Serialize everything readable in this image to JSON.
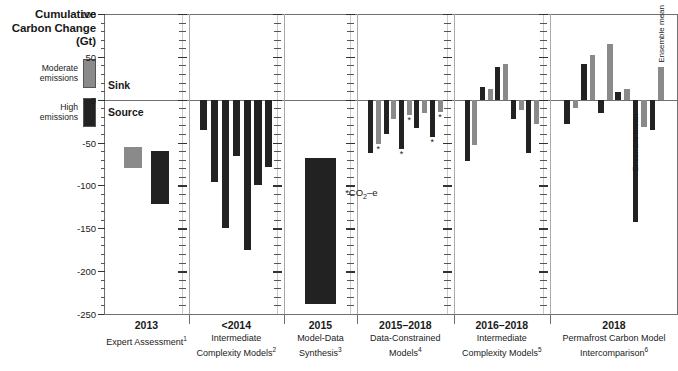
{
  "axis_title": "Cumulative\nCarbon\nChange (Gt)",
  "legend": {
    "items": [
      {
        "label": "Moderate\nemissions",
        "color": "#8a8a8a",
        "name": "moderate-emissions"
      },
      {
        "label": "High\nemissions",
        "color": "#222222",
        "name": "high-emissions"
      }
    ]
  },
  "inplot_labels": {
    "sink": "Sink",
    "source": "Source"
  },
  "annotations": [
    {
      "text": "*CO2-e",
      "html": "*CO<sub>2</sub>–e"
    }
  ],
  "chart_data": {
    "type": "bar",
    "title": "Cumulative Carbon Change (Gt)",
    "xlabel": "",
    "ylabel": "Cumulative Carbon Change (Gt)",
    "ylim": [
      -250,
      100
    ],
    "ytick_labels": [
      "100",
      "50",
      "0",
      "-50",
      "-100",
      "-150",
      "-200",
      "-250"
    ],
    "ytick_values": [
      100,
      50,
      0,
      -50,
      -100,
      -150,
      -200,
      -250
    ],
    "minor_tick_step": 10,
    "grid": false,
    "legend_position": "left",
    "zero_reference_labels": {
      "above": "Sink",
      "below": "Source"
    },
    "series_colors": {
      "moderate": "#8a8a8a",
      "high": "#222222"
    },
    "groups": [
      {
        "year": "2013",
        "name": "Expert Assessment",
        "footnote": "1",
        "bars": [
          {
            "value": -80,
            "start": -55,
            "series": "moderate",
            "asterisk": false,
            "note": ""
          },
          {
            "value": -122,
            "start": -60,
            "series": "high",
            "asterisk": false,
            "note": ""
          }
        ]
      },
      {
        "year": "<2014",
        "name": "Intermediate Complexity Models",
        "footnote": "2",
        "bars": [
          {
            "value": -35,
            "series": "high",
            "asterisk": false,
            "note": ""
          },
          {
            "value": -96,
            "series": "high",
            "asterisk": false,
            "note": ""
          },
          {
            "value": -150,
            "series": "high",
            "asterisk": false,
            "note": ""
          },
          {
            "value": -66,
            "series": "high",
            "asterisk": false,
            "note": ""
          },
          {
            "value": -175,
            "series": "high",
            "asterisk": false,
            "note": ""
          },
          {
            "value": -100,
            "series": "high",
            "asterisk": false,
            "note": ""
          },
          {
            "value": -78,
            "series": "high",
            "asterisk": false,
            "note": ""
          }
        ]
      },
      {
        "year": "2015",
        "name": "Model-Data Synthesis",
        "footnote": "3",
        "bars": [
          {
            "value": -238,
            "start": -68,
            "series": "high",
            "asterisk": false,
            "note": ""
          }
        ]
      },
      {
        "year": "2015–2018",
        "name": "Data-Constrained Models",
        "footnote": "4",
        "bars": [
          {
            "value": -62,
            "series": "high",
            "asterisk": false,
            "note": ""
          },
          {
            "value": -52,
            "series": "moderate",
            "asterisk": true,
            "note": ""
          },
          {
            "value": -40,
            "series": "high",
            "asterisk": false,
            "note": ""
          },
          {
            "value": -22,
            "series": "moderate",
            "asterisk": false,
            "note": ""
          },
          {
            "value": -58,
            "series": "high",
            "asterisk": true,
            "note": ""
          },
          {
            "value": -18,
            "series": "moderate",
            "asterisk": true,
            "note": ""
          },
          {
            "value": -33,
            "series": "high",
            "asterisk": false,
            "note": ""
          },
          {
            "value": -16,
            "series": "moderate",
            "asterisk": false,
            "note": ""
          },
          {
            "value": -44,
            "series": "high",
            "asterisk": true,
            "note": ""
          },
          {
            "value": -14,
            "series": "moderate",
            "asterisk": true,
            "note": ""
          }
        ]
      },
      {
        "year": "2016–2018",
        "name": "Intermediate Complexity Models",
        "footnote": "5",
        "bars": [
          {
            "value": -72,
            "series": "high",
            "asterisk": false,
            "note": ""
          },
          {
            "value": -53,
            "series": "moderate",
            "asterisk": false,
            "note": ""
          },
          {
            "value": 15,
            "series": "high",
            "asterisk": false,
            "note": ""
          },
          {
            "value": 12,
            "series": "moderate",
            "asterisk": false,
            "note": ""
          },
          {
            "value": 38,
            "series": "high",
            "asterisk": false,
            "note": ""
          },
          {
            "value": 42,
            "series": "moderate",
            "asterisk": false,
            "note": ""
          },
          {
            "value": -22,
            "series": "high",
            "asterisk": false,
            "note": ""
          },
          {
            "value": -12,
            "series": "moderate",
            "asterisk": false,
            "note": ""
          },
          {
            "value": -62,
            "series": "high",
            "asterisk": false,
            "note": ""
          },
          {
            "value": -28,
            "series": "moderate",
            "asterisk": false,
            "note": ""
          }
        ]
      },
      {
        "year": "2018",
        "name": "Permafrost Carbon Model Intercomparison",
        "footnote": "6",
        "bars": [
          {
            "value": -28,
            "series": "high",
            "asterisk": false,
            "note": ""
          },
          {
            "value": -10,
            "series": "moderate",
            "asterisk": false,
            "note": ""
          },
          {
            "value": 42,
            "series": "high",
            "asterisk": false,
            "note": ""
          },
          {
            "value": 52,
            "series": "moderate",
            "asterisk": false,
            "note": ""
          },
          {
            "value": -15,
            "series": "high",
            "asterisk": false,
            "note": ""
          },
          {
            "value": 65,
            "series": "moderate",
            "asterisk": false,
            "note": ""
          },
          {
            "value": 9,
            "series": "high",
            "asterisk": false,
            "note": ""
          },
          {
            "value": 12,
            "series": "moderate",
            "asterisk": false,
            "note": ""
          },
          {
            "value": -143,
            "series": "high",
            "asterisk": false,
            "note": "Ensemble mean"
          },
          {
            "value": -32,
            "series": "moderate",
            "asterisk": false,
            "note": ""
          },
          {
            "value": -35,
            "series": "high",
            "asterisk": false,
            "note": ""
          },
          {
            "value": 38,
            "series": "moderate",
            "asterisk": false,
            "note": "Ensemble mean"
          }
        ]
      }
    ]
  }
}
